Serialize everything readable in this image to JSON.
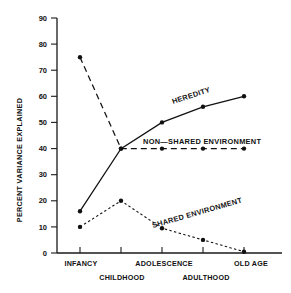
{
  "chart_data": {
    "type": "line",
    "title": "",
    "xlabel": "",
    "ylabel": "PERCENT VARIANCE EXPLAINED",
    "ylim": [
      0,
      90
    ],
    "yticks": [
      0,
      10,
      20,
      30,
      40,
      50,
      60,
      70,
      80,
      90
    ],
    "ytick_labels": [
      "0",
      "10",
      "20",
      "30",
      "40",
      "50",
      "60",
      "70",
      "80",
      "90"
    ],
    "categories": [
      "INFANCY",
      "CHILDHOOD",
      "ADOLESCENCE",
      "ADULTHOOD",
      "OLD AGE"
    ],
    "grid": false,
    "legend": "inline-annotations",
    "series": [
      {
        "name": "HEREDITY",
        "style": "solid",
        "values": [
          16,
          40,
          50,
          56,
          60
        ],
        "markers": [
          true,
          true,
          true,
          true,
          true
        ]
      },
      {
        "name": "NON—SHARED ENVIRONMENT",
        "style": "dashed",
        "values": [
          75,
          40,
          40,
          40,
          40
        ],
        "markers": [
          true,
          true,
          true,
          true,
          true
        ]
      },
      {
        "name": "SHARED ENVIRONMENT",
        "style": "dotted",
        "values": [
          10,
          20,
          9.5,
          5,
          0.5
        ],
        "markers": [
          true,
          true,
          true,
          true,
          true
        ]
      }
    ],
    "annotations": [
      {
        "text": "HEREDITY",
        "x": 175,
        "y": 102,
        "rotation": -18
      },
      {
        "text": "NON—SHARED ENVIRONMENT",
        "x": 148,
        "y": 143,
        "rotation": 0
      },
      {
        "text": "SHARED ENVIRONMENT",
        "x": 162,
        "y": 230,
        "rotation": -15
      }
    ]
  },
  "axis": {
    "y_title": "PERCENT VARIANCE EXPLAINED"
  },
  "xaxis": {
    "row_top": [
      "INFANCY",
      "ADOLESCENCE",
      "OLD AGE"
    ],
    "row_bottom": [
      "CHILDHOOD",
      "ADULTHOOD"
    ],
    "labels": {
      "infancy": "INFANCY",
      "childhood": "CHILDHOOD",
      "adolescence": "ADOLESCENCE",
      "adulthood": "ADULTHOOD",
      "old_age": "OLD AGE"
    }
  },
  "yaxis": {
    "t0": "0",
    "t10": "10",
    "t20": "20",
    "t30": "30",
    "t40": "40",
    "t50": "50",
    "t60": "60",
    "t70": "70",
    "t80": "80",
    "t90": "90"
  },
  "series_labels": {
    "heredity": "HEREDITY",
    "non_shared": "NON—SHARED ENVIRONMENT",
    "shared": "SHARED ENVIRONMENT"
  }
}
